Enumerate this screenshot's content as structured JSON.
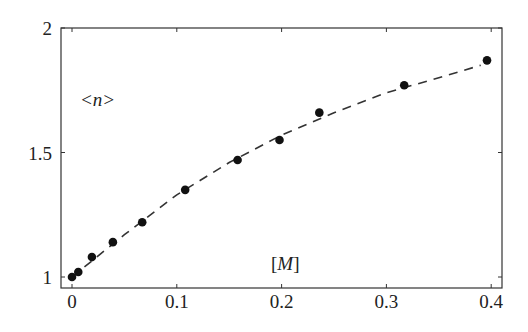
{
  "chart_data": {
    "type": "scatter",
    "title": "",
    "xlabel": "[M]",
    "ylabel": "<n>",
    "xlim": [
      -0.01,
      0.41
    ],
    "ylim": [
      0.96,
      2.0
    ],
    "x_ticks": [
      0,
      0.1,
      0.2,
      0.3,
      0.4
    ],
    "x_tick_labels": [
      "0",
      "0.1",
      "0.2",
      "0.3",
      "0.4"
    ],
    "y_ticks": [
      1,
      1.5,
      2
    ],
    "y_tick_labels": [
      "1",
      "1.5",
      "2"
    ],
    "grid": false,
    "legend": null,
    "series": [
      {
        "name": "measured",
        "style": "filled-circle markers",
        "x": [
          0.0,
          0.006,
          0.019,
          0.039,
          0.067,
          0.108,
          0.158,
          0.198,
          0.236,
          0.317,
          0.396
        ],
        "y": [
          1.0,
          1.02,
          1.08,
          1.14,
          1.22,
          1.35,
          1.47,
          1.55,
          1.66,
          1.77,
          1.87
        ]
      },
      {
        "name": "fit",
        "style": "dashed line",
        "x": [
          0.0,
          0.05,
          0.1,
          0.15,
          0.2,
          0.25,
          0.3,
          0.35,
          0.39
        ],
        "y": [
          1.0,
          1.17,
          1.33,
          1.46,
          1.57,
          1.66,
          1.74,
          1.8,
          1.85
        ]
      }
    ]
  },
  "labels": {
    "ylabel": "<n>",
    "xlabel_open": "[",
    "xlabel_var": "M",
    "xlabel_close": "]"
  }
}
